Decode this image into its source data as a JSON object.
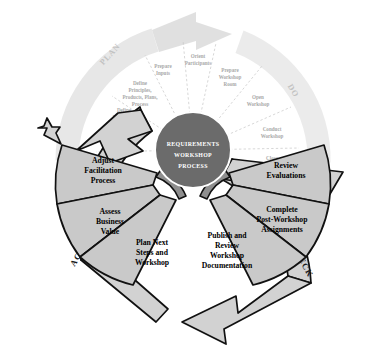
{
  "diagram": {
    "title": "Requirements Workshop Process",
    "type": "PDCA cycle wheel",
    "hub": {
      "line1": "REQUIREMENTS",
      "line2": "WORKSHOP",
      "line3": "PROCESS",
      "color": "#6b6b6b",
      "text_color": "#ffffff"
    },
    "quadrants": [
      {
        "id": "plan",
        "band_label": "PLAN",
        "style": "faint",
        "arrow_direction": "clockwise-top-right",
        "steps": [
          {
            "lines": [
              "Define",
              "Workshop",
              "Purpose and",
              "Participants"
            ]
          },
          {
            "lines": [
              "Define",
              "Principles,",
              "Products, Plans,",
              "Process"
            ]
          },
          {
            "lines": [
              "Prepare",
              "Inputs"
            ]
          },
          {
            "lines": [
              "Orient",
              "Participants"
            ]
          }
        ]
      },
      {
        "id": "do",
        "band_label": "DO",
        "style": "faint",
        "arrow_direction": "clockwise-right",
        "steps": [
          {
            "lines": [
              "Prepare",
              "Workshop",
              "Room"
            ]
          },
          {
            "lines": [
              "Open",
              "Workshop"
            ]
          },
          {
            "lines": [
              "Conduct",
              "Workshop"
            ]
          },
          {
            "lines": [
              "Close",
              "Workshop"
            ]
          }
        ]
      },
      {
        "id": "check",
        "band_label": "CHECK",
        "style": "solid",
        "arrow_direction": "clockwise-bottom-left",
        "steps": [
          {
            "lines": [
              "Review",
              "Evaluations"
            ]
          },
          {
            "lines": [
              "Complete",
              "Post-Workshop",
              "Assignments"
            ]
          },
          {
            "lines": [
              "Publish and",
              "Review",
              "Workshop",
              "Documentation"
            ]
          }
        ]
      },
      {
        "id": "act",
        "band_label": "ACT",
        "style": "solid",
        "arrow_direction": "clockwise-top-left",
        "steps": [
          {
            "lines": [
              "Adjust",
              "Facilitation",
              "Process"
            ]
          },
          {
            "lines": [
              "Assess",
              "Business",
              "Value"
            ]
          },
          {
            "lines": [
              "Plan Next",
              "Steps and",
              "Workshop"
            ]
          }
        ]
      }
    ],
    "colors": {
      "faint_band": "#d9d9d9",
      "faint_text": "#a9a9a9",
      "solid_wedge": "#c9c9c9",
      "solid_arm": "#d2d2d2",
      "arm_rim": "#8e8e8e",
      "outline": "#111111",
      "background": "#ffffff"
    }
  }
}
